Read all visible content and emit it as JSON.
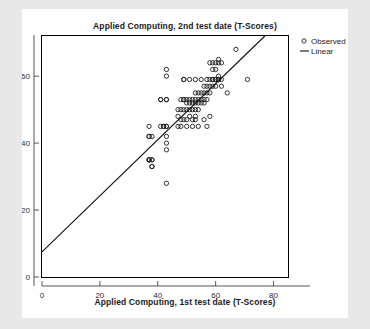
{
  "chart_data": {
    "type": "scatter",
    "title": "Applied Computing, 2nd test date (T-Scores)",
    "xlabel": "Applied Computing, 1st test date (T-Scores)",
    "ylabel": "",
    "xlim": [
      0,
      85
    ],
    "ylim": [
      0,
      72
    ],
    "xticks": [
      0,
      20,
      40,
      60,
      80
    ],
    "xtick_labels": [
      "0",
      "20",
      "40",
      "60",
      "80"
    ],
    "yticks": [
      0,
      20,
      40,
      60
    ],
    "ytick_labels": [
      "0",
      "20",
      "40",
      "60"
    ],
    "grid": false,
    "legend_position": "outside-top-right",
    "legend": [
      {
        "label": "Observed",
        "marker": "open-circle"
      },
      {
        "label": "Linear",
        "marker": "line"
      }
    ],
    "series": [
      {
        "name": "Observed",
        "marker": "open-circle",
        "points": [
          [
            37,
            45
          ],
          [
            37,
            42
          ],
          [
            37,
            42
          ],
          [
            37,
            35
          ],
          [
            37,
            35
          ],
          [
            37,
            35
          ],
          [
            38,
            35
          ],
          [
            38,
            35
          ],
          [
            38,
            33
          ],
          [
            38,
            33
          ],
          [
            38,
            42
          ],
          [
            41,
            53
          ],
          [
            41,
            53
          ],
          [
            41,
            45
          ],
          [
            42,
            45
          ],
          [
            42,
            45
          ],
          [
            43,
            62
          ],
          [
            43,
            60
          ],
          [
            43,
            53
          ],
          [
            43,
            53
          ],
          [
            43,
            45
          ],
          [
            43,
            45
          ],
          [
            43,
            42
          ],
          [
            43,
            40
          ],
          [
            43,
            38
          ],
          [
            43,
            28
          ],
          [
            47,
            50
          ],
          [
            47,
            48
          ],
          [
            47,
            45
          ],
          [
            48,
            53
          ],
          [
            48,
            50
          ],
          [
            48,
            47
          ],
          [
            48,
            45
          ],
          [
            49,
            59
          ],
          [
            49,
            59
          ],
          [
            49,
            53
          ],
          [
            49,
            53
          ],
          [
            49,
            50
          ],
          [
            49,
            47
          ],
          [
            50,
            53
          ],
          [
            50,
            52
          ],
          [
            50,
            50
          ],
          [
            50,
            47
          ],
          [
            50,
            45
          ],
          [
            51,
            59
          ],
          [
            51,
            53
          ],
          [
            51,
            52
          ],
          [
            51,
            50
          ],
          [
            51,
            48
          ],
          [
            52,
            53
          ],
          [
            52,
            52
          ],
          [
            52,
            50
          ],
          [
            52,
            47
          ],
          [
            52,
            45
          ],
          [
            53,
            59
          ],
          [
            53,
            55
          ],
          [
            53,
            53
          ],
          [
            53,
            52
          ],
          [
            53,
            50
          ],
          [
            53,
            48
          ],
          [
            53,
            47
          ],
          [
            54,
            55
          ],
          [
            54,
            53
          ],
          [
            54,
            52
          ],
          [
            54,
            50
          ],
          [
            54,
            45
          ],
          [
            55,
            59
          ],
          [
            55,
            55
          ],
          [
            55,
            53
          ],
          [
            55,
            52
          ],
          [
            56,
            57
          ],
          [
            56,
            55
          ],
          [
            56,
            53
          ],
          [
            56,
            52
          ],
          [
            56,
            47
          ],
          [
            57,
            59
          ],
          [
            57,
            57
          ],
          [
            57,
            55
          ],
          [
            57,
            53
          ],
          [
            57,
            45
          ],
          [
            58,
            64
          ],
          [
            58,
            59
          ],
          [
            58,
            57
          ],
          [
            58,
            55
          ],
          [
            58,
            48
          ],
          [
            59,
            64
          ],
          [
            59,
            62
          ],
          [
            59,
            59
          ],
          [
            59,
            59
          ],
          [
            59,
            57
          ],
          [
            60,
            64
          ],
          [
            60,
            62
          ],
          [
            60,
            59
          ],
          [
            60,
            59
          ],
          [
            60,
            57
          ],
          [
            61,
            65
          ],
          [
            61,
            64
          ],
          [
            61,
            60
          ],
          [
            61,
            59
          ],
          [
            61,
            59
          ],
          [
            62,
            64
          ],
          [
            62,
            59
          ],
          [
            62,
            57
          ],
          [
            64,
            55
          ],
          [
            67,
            68
          ],
          [
            71,
            59
          ]
        ]
      }
    ],
    "fit_line": {
      "name": "Linear",
      "x_start": 0,
      "y_start": 7.5,
      "x_end": 77,
      "y_end": 72
    }
  }
}
